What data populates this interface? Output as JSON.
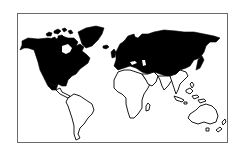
{
  "map": {
    "title": "World map",
    "style": "line-art with filled regions",
    "colors": {
      "filled": "#000000",
      "outline": "#000000",
      "background": "#ffffff",
      "frame": "#6a6a6a"
    },
    "filled_regions": [
      "North America",
      "Greenland",
      "Europe",
      "Russia / Northern Asia",
      "Japan"
    ],
    "outlined_regions": [
      "Central America",
      "South America",
      "Africa",
      "Madagascar",
      "Middle East",
      "South Asia",
      "Southeast Asia",
      "Indonesia",
      "Australia",
      "New Zealand"
    ]
  }
}
